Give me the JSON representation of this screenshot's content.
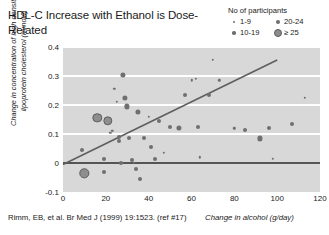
{
  "title": "HDL-C Increase with Ethanol is Dose-Related",
  "citation": "Rimm, EB, et al. Br Med J (1999) 19:1523. (ref #17)",
  "legend": {
    "title": "No of participants",
    "items": [
      {
        "label": "1-9",
        "size_class": "lg-s1"
      },
      {
        "label": "20-24",
        "size_class": "lg-s3"
      },
      {
        "label": "10-19",
        "size_class": "lg-s2"
      },
      {
        "label": "≥ 25",
        "size_class": "lg-s4"
      }
    ]
  },
  "colors": {
    "plot_background": "#d8d8d8",
    "gridline": "#ffffff",
    "zero_line": "#555555",
    "regression_line": "#5f5f5f",
    "marker": "#6f6f6f",
    "marker_large": "#8e8e8e",
    "text": "#1a1a1a"
  },
  "chart_data": {
    "type": "scatter",
    "title": "HDL-C Increase with Ethanol is Dose-Related",
    "xlabel": "Change in alcohol (g/day)",
    "ylabel": "Change in concentration of high density lipoprotein cholesterol (mmol/l)",
    "xlim": [
      0,
      120
    ],
    "ylim": [
      -0.1,
      0.4
    ],
    "xticks": [
      0,
      20,
      40,
      60,
      80,
      100,
      120
    ],
    "yticks": [
      -0.1,
      0,
      0.1,
      0.2,
      0.3,
      0.4
    ],
    "grid": "horizontal-white-bands",
    "legend_position": "top-right",
    "size_legend": {
      "name": "No of participants",
      "bins": [
        "1-9",
        "10-19",
        "20-24",
        "≥ 25"
      ]
    },
    "reference_lines": [
      {
        "name": "zero-line",
        "type": "horizontal",
        "y": 0
      }
    ],
    "trendline": {
      "name": "regression-line",
      "x": [
        0,
        100
      ],
      "y": [
        -0.005,
        0.355
      ]
    },
    "points": [
      {
        "x": 9,
        "y": 0.045,
        "n": "10-19"
      },
      {
        "x": 10,
        "y": -0.035,
        "n": "≥ 25"
      },
      {
        "x": 16,
        "y": 0.155,
        "n": "≥ 25"
      },
      {
        "x": 19,
        "y": 0.015,
        "n": "10-19"
      },
      {
        "x": 19,
        "y": -0.03,
        "n": "10-19"
      },
      {
        "x": 21,
        "y": 0.145,
        "n": "≥ 25"
      },
      {
        "x": 22,
        "y": 0.105,
        "n": "1-9"
      },
      {
        "x": 23,
        "y": 0.11,
        "n": "1-9"
      },
      {
        "x": 24,
        "y": 0.255,
        "n": "1-9"
      },
      {
        "x": 25,
        "y": 0.21,
        "n": "1-9"
      },
      {
        "x": 26,
        "y": 0.09,
        "n": "10-19"
      },
      {
        "x": 26,
        "y": 0.075,
        "n": "10-19"
      },
      {
        "x": 27,
        "y": 0.0,
        "n": "10-19"
      },
      {
        "x": 28,
        "y": 0.305,
        "n": "20-24"
      },
      {
        "x": 29,
        "y": 0.225,
        "n": "20-24"
      },
      {
        "x": 30,
        "y": 0.195,
        "n": "20-24"
      },
      {
        "x": 31,
        "y": 0.085,
        "n": "10-19"
      },
      {
        "x": 32,
        "y": 0.01,
        "n": "10-19"
      },
      {
        "x": 33,
        "y": 0.0,
        "n": "1-9"
      },
      {
        "x": 34,
        "y": -0.02,
        "n": "10-19"
      },
      {
        "x": 35,
        "y": 0.175,
        "n": "20-24"
      },
      {
        "x": 36,
        "y": -0.055,
        "n": "10-19"
      },
      {
        "x": 38,
        "y": 0.085,
        "n": "10-19"
      },
      {
        "x": 40,
        "y": 0.16,
        "n": "1-9"
      },
      {
        "x": 41,
        "y": 0.055,
        "n": "10-19"
      },
      {
        "x": 43,
        "y": 0.015,
        "n": "10-19"
      },
      {
        "x": 45,
        "y": 0.145,
        "n": "10-19"
      },
      {
        "x": 47,
        "y": 0.035,
        "n": "1-9"
      },
      {
        "x": 50,
        "y": 0.125,
        "n": "10-19"
      },
      {
        "x": 54,
        "y": 0.12,
        "n": "20-24"
      },
      {
        "x": 57,
        "y": 0.235,
        "n": "10-19"
      },
      {
        "x": 60,
        "y": 0.285,
        "n": "1-9"
      },
      {
        "x": 62,
        "y": 0.29,
        "n": "1-9"
      },
      {
        "x": 63,
        "y": 0.125,
        "n": "10-19"
      },
      {
        "x": 64,
        "y": 0.02,
        "n": "1-9"
      },
      {
        "x": 68,
        "y": 0.235,
        "n": "10-19"
      },
      {
        "x": 70,
        "y": 0.355,
        "n": "1-9"
      },
      {
        "x": 73,
        "y": 0.285,
        "n": "1-9"
      },
      {
        "x": 80,
        "y": 0.12,
        "n": "1-9"
      },
      {
        "x": 85,
        "y": 0.115,
        "n": "10-19"
      },
      {
        "x": 92,
        "y": 0.085,
        "n": "20-24"
      },
      {
        "x": 96,
        "y": 0.12,
        "n": "10-19"
      },
      {
        "x": 98,
        "y": 0.015,
        "n": "1-9"
      },
      {
        "x": 107,
        "y": 0.135,
        "n": "10-19"
      },
      {
        "x": 113,
        "y": 0.225,
        "n": "1-9"
      }
    ]
  }
}
